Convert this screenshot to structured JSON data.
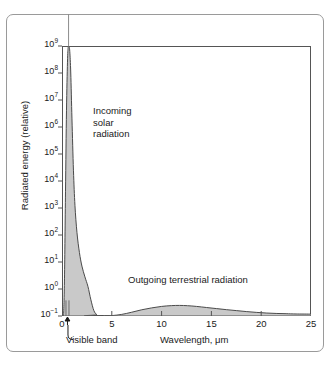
{
  "chart_data": {
    "type": "area",
    "title": "",
    "xlabel": "Wavelength, μm",
    "ylabel": "Radiated energy (relative)",
    "xlim": [
      0,
      25
    ],
    "ylim_log10": [
      -1,
      9
    ],
    "yscale": "log",
    "grid": false,
    "legend_position": "none",
    "xticks": [
      "0",
      "5",
      "10",
      "15",
      "20",
      "25"
    ],
    "xtick_values": [
      0,
      5,
      10,
      15,
      20,
      25
    ],
    "yticks": [
      "10⁻¹",
      "10⁰",
      "10¹",
      "10²",
      "10³",
      "10⁴",
      "10⁵",
      "10⁶",
      "10⁷",
      "10⁸",
      "10⁹"
    ],
    "ytick_exponents": [
      -1,
      0,
      1,
      2,
      3,
      4,
      5,
      6,
      7,
      8,
      9
    ],
    "ytick_mantissa": "10",
    "series": [
      {
        "name": "Incoming solar radiation",
        "fill_color": "#c9c9c9",
        "line_color": "#4a4a4a",
        "points_log10": [
          [
            0.0,
            -1.0
          ],
          [
            0.15,
            -1.0
          ],
          [
            0.25,
            0.4
          ],
          [
            0.35,
            3.6
          ],
          [
            0.45,
            6.6
          ],
          [
            0.55,
            8.4
          ],
          [
            0.62,
            8.95
          ],
          [
            0.7,
            9.0
          ],
          [
            0.78,
            8.8
          ],
          [
            0.88,
            8.0
          ],
          [
            1.0,
            6.3
          ],
          [
            1.15,
            4.4
          ],
          [
            1.3,
            3.1
          ],
          [
            1.5,
            2.1
          ],
          [
            1.75,
            1.35
          ],
          [
            2.0,
            0.85
          ],
          [
            2.3,
            0.45
          ],
          [
            2.6,
            0.1
          ],
          [
            2.9,
            -0.4
          ],
          [
            3.2,
            -0.8
          ],
          [
            3.5,
            -0.95
          ],
          [
            3.9,
            -1.0
          ],
          [
            25.0,
            -1.0
          ]
        ]
      },
      {
        "name": "Outgoing terrestrial radiation",
        "fill_color": "#c9c9c9",
        "line_color": "#4a4a4a",
        "points_log10": [
          [
            4.0,
            -1.0
          ],
          [
            5.0,
            -0.985
          ],
          [
            6.0,
            -0.94
          ],
          [
            7.0,
            -0.86
          ],
          [
            8.0,
            -0.77
          ],
          [
            9.0,
            -0.7
          ],
          [
            10.0,
            -0.645
          ],
          [
            11.0,
            -0.615
          ],
          [
            11.8,
            -0.608
          ],
          [
            12.6,
            -0.618
          ],
          [
            13.5,
            -0.645
          ],
          [
            14.5,
            -0.685
          ],
          [
            15.5,
            -0.725
          ],
          [
            16.5,
            -0.765
          ],
          [
            17.5,
            -0.8
          ],
          [
            18.5,
            -0.835
          ],
          [
            19.5,
            -0.865
          ],
          [
            20.5,
            -0.89
          ],
          [
            21.5,
            -0.905
          ],
          [
            22.5,
            -0.915
          ],
          [
            23.5,
            -0.925
          ],
          [
            25.0,
            -0.93
          ]
        ]
      }
    ],
    "annotations": [
      {
        "name": "incoming-solar-radiation",
        "lines": [
          "Incoming",
          "solar",
          "radiation"
        ],
        "x_um": 2.0,
        "y_log10": 6.2
      },
      {
        "name": "outgoing-terrestrial-radiation",
        "text": "Outgoing terrestrial radiation",
        "x_um": 11.5,
        "y_log10": -0.25
      },
      {
        "name": "visible-band",
        "text": "Visible band",
        "x_um": 0.55,
        "band_min_um": 0.4,
        "band_max_um": 0.7
      }
    ]
  },
  "axes": {
    "y_axis_title": "Radiated energy (relative)",
    "x_axis_title": "Wavelength, μm"
  },
  "labels": {
    "incoming_line_1": "Incoming",
    "incoming_line_2": "solar",
    "incoming_line_3": "radiation",
    "outgoing": "Outgoing terrestrial radiation",
    "visible_band": "Visible band"
  },
  "colors": {
    "fill": "#c9c9c9",
    "curve_line": "#4a4a4a",
    "axis": "#555555",
    "outer_frame": "#9a9a9a",
    "text": "#1a1a1a",
    "background": "#ffffff"
  }
}
